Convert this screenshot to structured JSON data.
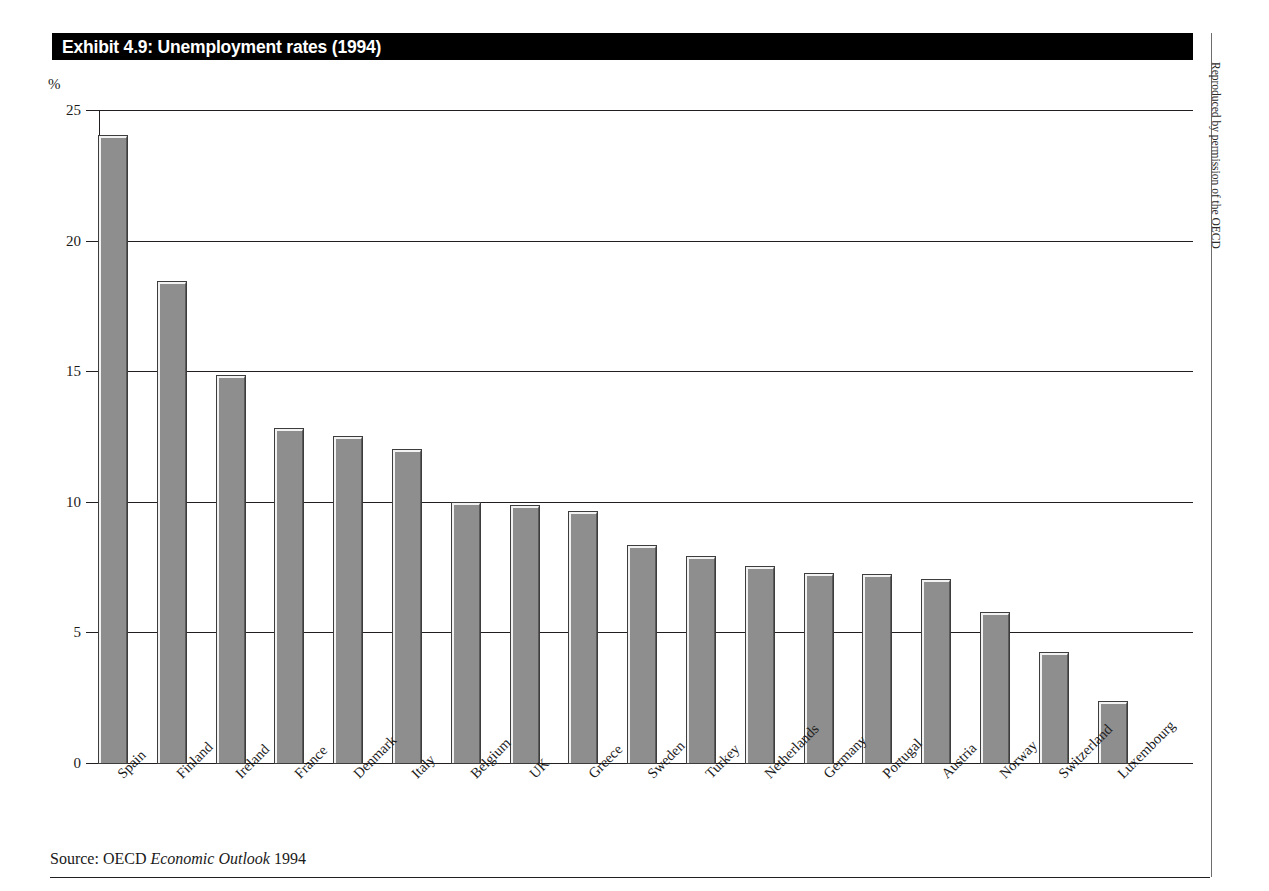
{
  "figure": {
    "title": "Exhibit 4.9: Unemployment rates (1994)",
    "axis_unit": "%",
    "source_prefix": "Source: OECD ",
    "source_italic": "Economic Outlook",
    "source_suffix": " 1994",
    "credit": "Reproduced by permission of the OECD",
    "title_bar_color": "#000000",
    "title_text_color": "#ffffff",
    "bar_fill_color": "#8e8e8e",
    "bar_highlight_color": "#f2f2f2",
    "bar_outline_color": "#3d3d3d",
    "gridline_color": "#231f20"
  },
  "chart_data": {
    "type": "bar",
    "title": "Exhibit 4.9: Unemployment rates (1994)",
    "xlabel": "",
    "ylabel": "%",
    "ylim": [
      0,
      25
    ],
    "yticks": [
      0,
      5,
      10,
      15,
      20,
      25
    ],
    "ytick_labels": [
      "0",
      "5",
      "10",
      "15",
      "20",
      "25"
    ],
    "grid": true,
    "legend": null,
    "categories": [
      "Spain",
      "Finland",
      "Ireland",
      "France",
      "Denmark",
      "Italy",
      "Belgium",
      "UK",
      "Greece",
      "Sweden",
      "Turkey",
      "Netherlands",
      "Germany",
      "Portugal",
      "Austria",
      "Norway",
      "Switzerland",
      "Luxembourg"
    ],
    "values": [
      24.0,
      18.4,
      14.8,
      12.8,
      12.5,
      12.0,
      9.95,
      9.85,
      9.6,
      8.3,
      7.9,
      7.5,
      7.25,
      7.2,
      7.0,
      5.75,
      4.2,
      2.35
    ],
    "units": "percent",
    "source": "OECD Economic Outlook 1994"
  }
}
